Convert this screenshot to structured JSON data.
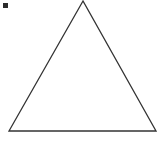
{
  "diagram": {
    "shape": "triangle",
    "type": "equilateral-outline",
    "stroke_color": "#333333",
    "fill_color": "#ffffff",
    "vertices": [
      [
        83,
        1
      ],
      [
        9,
        131
      ],
      [
        156,
        131
      ]
    ],
    "marker": {
      "shape": "square",
      "color": "#2b2b2b"
    }
  }
}
